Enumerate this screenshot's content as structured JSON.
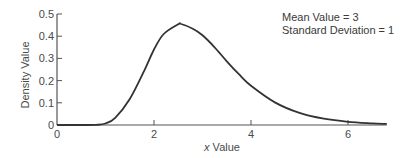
{
  "chart_data": {
    "type": "line",
    "title": "",
    "xlabel_italic": "x",
    "xlabel_rest": " Value",
    "xlabel": "x Value",
    "ylabel": "Density Value",
    "xlim": [
      0,
      6.8
    ],
    "ylim": [
      0,
      0.5
    ],
    "x_ticks": [
      0,
      2,
      4,
      6
    ],
    "y_ticks": [
      0,
      0.1,
      0.2,
      0.3,
      0.4,
      0.5
    ],
    "y_tick_labels": [
      "0",
      "0.1",
      "0.2",
      "0.3",
      "0.4",
      "0.5"
    ],
    "grid": false,
    "annotations": [
      "Mean Value = 3",
      "Standard Deviation = 1"
    ],
    "series": [
      {
        "name": "lognormal density",
        "color": "#333333",
        "x": [
          0.0,
          0.5,
          0.8,
          1.0,
          1.2,
          1.5,
          1.8,
          2.0,
          2.2,
          2.5,
          2.56,
          2.8,
          3.0,
          3.25,
          3.5,
          3.75,
          4.0,
          4.5,
          5.0,
          5.5,
          6.0,
          6.5,
          6.8
        ],
        "values": [
          0.0,
          0.0,
          0.0005,
          0.0068,
          0.032,
          0.117,
          0.245,
          0.34,
          0.41,
          0.454,
          0.455,
          0.434,
          0.404,
          0.35,
          0.287,
          0.229,
          0.177,
          0.101,
          0.0545,
          0.0285,
          0.0146,
          0.0074,
          0.0049
        ]
      }
    ]
  }
}
